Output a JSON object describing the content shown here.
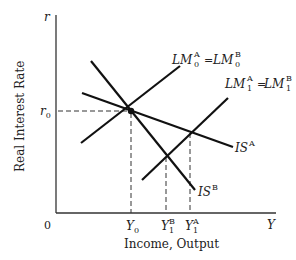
{
  "diagram": {
    "type": "IS-LM diagram",
    "axes": {
      "y_axis_symbol": "r",
      "y_axis_title": "Real Interest Rate",
      "x_axis_symbol": "Y",
      "x_axis_title": "Income, Output",
      "origin_label": "0"
    },
    "tick_labels": {
      "r0": {
        "base": "r",
        "sub": "0"
      },
      "Y0": {
        "base": "Y",
        "sub": "0"
      },
      "Y1B": {
        "base": "Y",
        "sub": "1",
        "sup": "B"
      },
      "Y1A": {
        "base": "Y",
        "sub": "1",
        "sup": "A"
      }
    },
    "curves": {
      "LM0": {
        "left": {
          "base": "LM",
          "sub": "0",
          "sup": "A"
        },
        "eq": "=",
        "right": {
          "base": "LM",
          "sub": "0",
          "sup": "B"
        }
      },
      "LM1": {
        "left": {
          "base": "LM",
          "sub": "1",
          "sup": "A"
        },
        "eq": "=",
        "right": {
          "base": "LM",
          "sub": "1",
          "sup": "B"
        }
      },
      "ISA": {
        "base": "IS",
        "sup": "A"
      },
      "ISB": {
        "base": "IS",
        "sup": "B"
      }
    },
    "colors": {
      "line": "#111111",
      "text": "#222222",
      "axis": "#333333"
    }
  }
}
